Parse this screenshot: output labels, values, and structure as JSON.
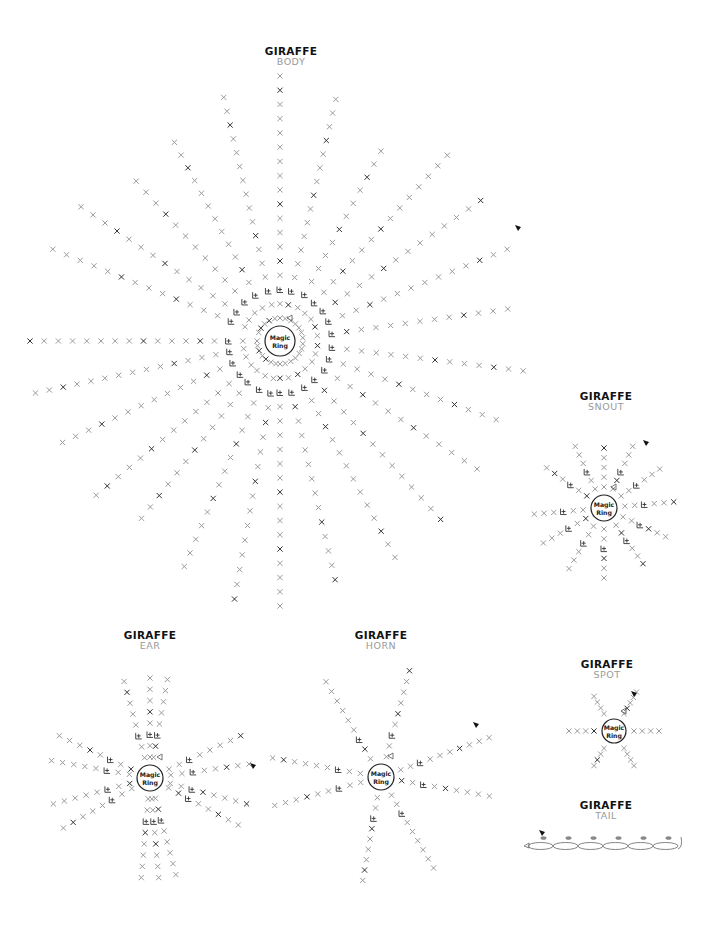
{
  "diagrams": [
    {
      "id": "body",
      "title": "GIRAFFE",
      "subtitle": "BODY",
      "label_x": 291,
      "label_y": 45,
      "center": [
        280,
        341
      ],
      "ring_r": 15,
      "ring_label": [
        "Magic",
        "Ring"
      ],
      "spokes": [
        {
          "angle": -90,
          "len": 265,
          "count": 18
        },
        {
          "angle": -77,
          "len": 248,
          "count": 17
        },
        {
          "angle": -103,
          "len": 250,
          "count": 17
        },
        {
          "angle": -62,
          "len": 215,
          "count": 14
        },
        {
          "angle": -118,
          "len": 225,
          "count": 15
        },
        {
          "angle": -48,
          "len": 250,
          "count": 17
        },
        {
          "angle": -132,
          "len": 215,
          "count": 14
        },
        {
          "angle": -35,
          "len": 245,
          "count": 16
        },
        {
          "angle": -146,
          "len": 240,
          "count": 16
        },
        {
          "angle": -22,
          "len": 245,
          "count": 16
        },
        {
          "angle": -158,
          "len": 245,
          "count": 16
        },
        {
          "angle": -8,
          "len": 230,
          "count": 15
        },
        {
          "angle": 180,
          "len": 250,
          "count": 17
        },
        {
          "angle": 7,
          "len": 245,
          "count": 16
        },
        {
          "angle": 168,
          "len": 250,
          "count": 17
        },
        {
          "angle": 20,
          "len": 230,
          "count": 15
        },
        {
          "angle": 155,
          "len": 240,
          "count": 16
        },
        {
          "angle": 33,
          "len": 235,
          "count": 15
        },
        {
          "angle": 140,
          "len": 240,
          "count": 16
        },
        {
          "angle": 48,
          "len": 240,
          "count": 16
        },
        {
          "angle": 128,
          "len": 225,
          "count": 15
        },
        {
          "angle": 62,
          "len": 245,
          "count": 16
        },
        {
          "angle": 113,
          "len": 245,
          "count": 16
        },
        {
          "angle": 77,
          "len": 245,
          "count": 16
        },
        {
          "angle": 100,
          "len": 262,
          "count": 17
        },
        {
          "angle": 90,
          "len": 265,
          "count": 18
        }
      ],
      "marker": [
        518,
        228
      ]
    },
    {
      "id": "snout",
      "title": "GIRAFFE",
      "subtitle": "SNOUT",
      "label_x": 606,
      "label_y": 392,
      "center": [
        604,
        508
      ],
      "ring_r": 13,
      "ring_label": [
        "Magic",
        "Ring"
      ],
      "spokes": [
        {
          "angle": -90,
          "len": 60,
          "count": 5
        },
        {
          "angle": -65,
          "len": 68,
          "count": 6
        },
        {
          "angle": -115,
          "len": 68,
          "count": 6
        },
        {
          "angle": -35,
          "len": 68,
          "count": 6
        },
        {
          "angle": -145,
          "len": 70,
          "count": 6
        },
        {
          "angle": -5,
          "len": 70,
          "count": 6
        },
        {
          "angle": 175,
          "len": 70,
          "count": 6
        },
        {
          "angle": 25,
          "len": 68,
          "count": 6
        },
        {
          "angle": 150,
          "len": 70,
          "count": 6
        },
        {
          "angle": 55,
          "len": 68,
          "count": 6
        },
        {
          "angle": 120,
          "len": 70,
          "count": 6
        },
        {
          "angle": 90,
          "len": 70,
          "count": 6
        }
      ],
      "marker": [
        646,
        443
      ]
    },
    {
      "id": "ear",
      "title": "GIRAFFE",
      "subtitle": "EAR",
      "label_x": 150,
      "label_y": 630,
      "center": [
        150,
        778
      ],
      "ring_r": 13,
      "ring_label": [
        "Magic",
        "Ring"
      ],
      "spokes": [
        {
          "angle": -90,
          "len": 100,
          "count": 8
        },
        {
          "angle": -80,
          "len": 100,
          "count": 8
        },
        {
          "angle": -105,
          "len": 100,
          "count": 8
        },
        {
          "angle": -25,
          "len": 100,
          "count": 8
        },
        {
          "angle": -155,
          "len": 100,
          "count": 8
        },
        {
          "angle": -8,
          "len": 100,
          "count": 8
        },
        {
          "angle": -170,
          "len": 100,
          "count": 8
        },
        {
          "angle": 15,
          "len": 100,
          "count": 8
        },
        {
          "angle": 165,
          "len": 100,
          "count": 8
        },
        {
          "angle": 28,
          "len": 100,
          "count": 8
        },
        {
          "angle": 150,
          "len": 100,
          "count": 8
        },
        {
          "angle": 95,
          "len": 100,
          "count": 8
        },
        {
          "angle": 85,
          "len": 100,
          "count": 8
        },
        {
          "angle": 75,
          "len": 100,
          "count": 8
        }
      ],
      "marker": [
        253,
        766
      ]
    },
    {
      "id": "horn",
      "title": "GIRAFFE",
      "subtitle": "HORN",
      "label_x": 381,
      "label_y": 630,
      "center": [
        381,
        777
      ],
      "ring_r": 13,
      "ring_label": [
        "Magic",
        "Ring"
      ],
      "spokes": [
        {
          "angle": -75,
          "len": 110,
          "count": 9
        },
        {
          "angle": -120,
          "len": 110,
          "count": 9
        },
        {
          "angle": -20,
          "len": 115,
          "count": 10
        },
        {
          "angle": -170,
          "len": 110,
          "count": 9
        },
        {
          "angle": 10,
          "len": 110,
          "count": 9
        },
        {
          "angle": 165,
          "len": 110,
          "count": 9
        },
        {
          "angle": 60,
          "len": 105,
          "count": 9
        },
        {
          "angle": 100,
          "len": 105,
          "count": 9
        }
      ],
      "marker": [
        476,
        725
      ]
    },
    {
      "id": "spot",
      "title": "GIRAFFE",
      "subtitle": "SPOT",
      "label_x": 607,
      "label_y": 660,
      "center": [
        614,
        731
      ],
      "ring_r": 12,
      "ring_label": [
        "Magic",
        "Ring"
      ],
      "spokes": [
        {
          "angle": -120,
          "len": 40,
          "count": 4
        },
        {
          "angle": -60,
          "len": 45,
          "count": 5
        },
        {
          "angle": 120,
          "len": 40,
          "count": 4
        },
        {
          "angle": 60,
          "len": 40,
          "count": 4
        },
        {
          "angle": 180,
          "len": 45,
          "count": 4
        },
        {
          "angle": 0,
          "len": 45,
          "count": 4
        }
      ],
      "marker": [
        634,
        694
      ]
    },
    {
      "id": "tail",
      "title": "GIRAFFE",
      "subtitle": "TAIL",
      "label_x": 606,
      "label_y": 800,
      "chain": {
        "x": 528,
        "y": 846,
        "count": 6,
        "w": 25
      },
      "marker": [
        542,
        833
      ]
    }
  ],
  "colors": {
    "dark": "#333333",
    "light": "#9b9b9b",
    "line": "#8a8a8a",
    "title": "#111111",
    "subtitle": "#9a9a9a"
  }
}
